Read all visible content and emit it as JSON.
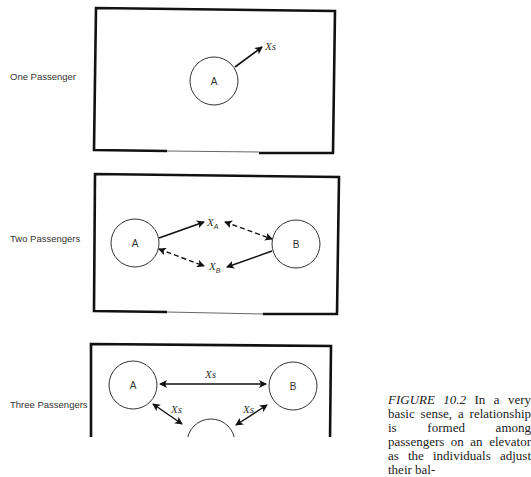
{
  "figure": {
    "panels": [
      {
        "label": "One Passenger",
        "nodes": [
          "A"
        ],
        "space_labels": [
          "Xs"
        ]
      },
      {
        "label": "Two Passengers",
        "nodes": [
          "A",
          "B"
        ],
        "space_labels": [
          {
            "base": "X",
            "sub": "A"
          },
          {
            "base": "X",
            "sub": "B"
          }
        ]
      },
      {
        "label": "Three Passengers",
        "nodes": [
          "A",
          "B"
        ],
        "space_labels": [
          "Xs",
          "Xs",
          "Xs"
        ]
      }
    ],
    "caption": {
      "figure_number": "FIGURE 10.2",
      "text": " In a very basic sense, a relationship is formed among passengers on an elevator as the individuals adjust their bal-"
    }
  }
}
